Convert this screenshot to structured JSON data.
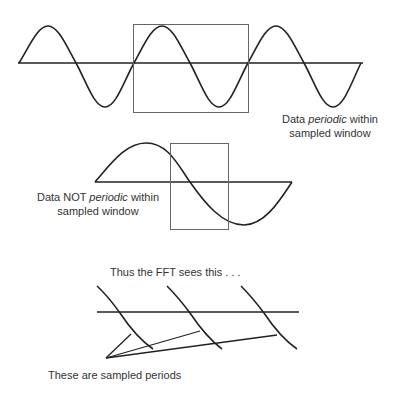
{
  "panels": {
    "periodic": {
      "caption_line1_prefix": "Data ",
      "caption_line1_emph": "periodic",
      "caption_line1_suffix": " within",
      "caption_line2": "sampled window"
    },
    "not_periodic": {
      "caption_line1_prefix": "Data NOT ",
      "caption_line1_emph": "periodic",
      "caption_line1_suffix": " within",
      "caption_line2": "sampled window"
    },
    "fft_view": {
      "title": "Thus the FFT sees this . . .",
      "pointer_caption": "These are sampled periods"
    }
  },
  "colors": {
    "stroke": "#222222",
    "window_box": "#666666",
    "background": "#ffffff"
  }
}
